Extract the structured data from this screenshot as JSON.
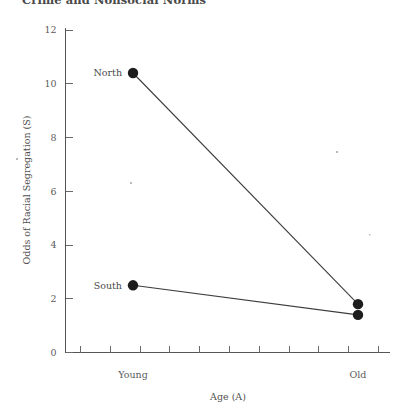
{
  "page": {
    "running_heading": "Crime and Nonsocial Norms",
    "background_color": "#ffffff",
    "ink_color": "#3d3d3d"
  },
  "chart_data": {
    "type": "line",
    "title": "",
    "subtitle": "",
    "xlabel": "Age (A)",
    "ylabel": "Odds of Racial Segregation (S)",
    "categories": [
      "Young",
      "Old"
    ],
    "x": [
      0,
      1
    ],
    "xlim": [
      -0.12,
      1.12
    ],
    "ylim": [
      0,
      12
    ],
    "yticks": [
      0,
      2,
      4,
      6,
      8,
      10,
      12
    ],
    "ytick_labels": [
      "0",
      "2",
      "4",
      "6",
      "8",
      "10",
      "12"
    ],
    "xticks_unlabeled_count": 11,
    "grid": false,
    "legend": "inline-endpoint-labels",
    "legend_position": "left-of-first-point",
    "marker": "filled-circle",
    "series": [
      {
        "name": "North",
        "label": "North",
        "values": [
          10.4,
          1.8
        ],
        "color": "#1d1d1d"
      },
      {
        "name": "South",
        "label": "South",
        "values": [
          2.5,
          1.4
        ],
        "color": "#1d1d1d"
      }
    ],
    "annotations": [
      {
        "text": "North",
        "series": "North",
        "at_category": "Young"
      },
      {
        "text": "South",
        "series": "South",
        "at_category": "Young"
      }
    ]
  }
}
